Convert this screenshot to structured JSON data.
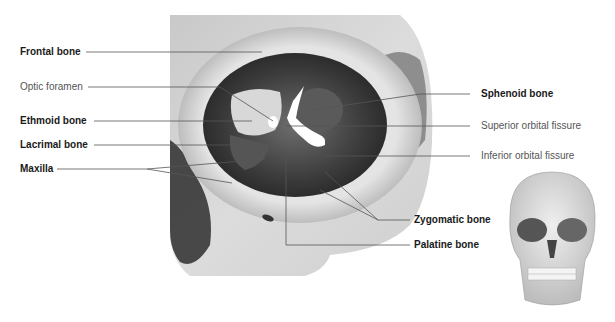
{
  "figure": {
    "labels_left": [
      {
        "id": "frontal",
        "text": "Frontal bone",
        "bold": true
      },
      {
        "id": "optic",
        "text": "Optic foramen",
        "bold": false
      },
      {
        "id": "ethmoid",
        "text": "Ethmoid bone",
        "bold": true
      },
      {
        "id": "lacrimal",
        "text": "Lacrimal bone",
        "bold": true
      },
      {
        "id": "maxilla",
        "text": "Maxilla",
        "bold": true
      }
    ],
    "labels_right": [
      {
        "id": "sphenoid",
        "text": "Sphenoid bone",
        "bold": true
      },
      {
        "id": "sup_fissure",
        "text": "Superior orbital fissure",
        "bold": false
      },
      {
        "id": "inf_fissure",
        "text": "Inferior orbital fissure",
        "bold": false
      },
      {
        "id": "zygomatic",
        "text": "Zygomatic bone",
        "bold": true
      },
      {
        "id": "palatine",
        "text": "Palatine bone",
        "bold": true
      }
    ],
    "inset": "skull-front-view"
  }
}
